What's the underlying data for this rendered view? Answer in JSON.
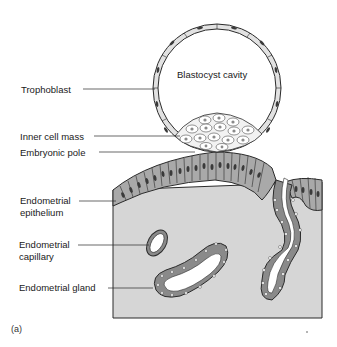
{
  "figure": {
    "panel_label": "(a)",
    "interior_label": "Blastocyst cavity",
    "labels": [
      {
        "id": "trophoblast",
        "text": "Trophoblast"
      },
      {
        "id": "inner-cell-mass",
        "text": "Inner cell mass"
      },
      {
        "id": "embryonic-pole",
        "text": "Embryonic pole"
      },
      {
        "id": "endometrial-epithelium",
        "line1": "Endometrial",
        "line2": "epithelium"
      },
      {
        "id": "endometrial-capillary",
        "line1": "Endometrial",
        "line2": "capillary"
      },
      {
        "id": "endometrial-gland",
        "text": "Endometrial gland"
      }
    ],
    "colors": {
      "stroma": "#d6d6d6",
      "epithelium": "#a9a9a9",
      "nucleus": "#3a3a3a",
      "outline": "#2a2a2a",
      "lumen": "#ffffff"
    }
  }
}
